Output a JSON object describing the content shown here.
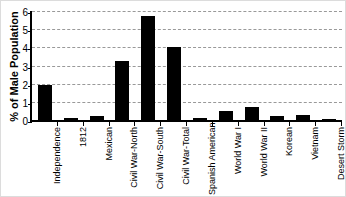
{
  "chart_data": {
    "type": "bar",
    "title": "",
    "xlabel": "",
    "ylabel": "% of Male Population",
    "categories": [
      "Independence",
      "1812",
      "Mexican",
      "Civil War-North",
      "Civil War-South",
      "Civil War-Total",
      "Spanish American",
      "World War I",
      "World War II",
      "Korean",
      "Vietnam",
      "Desert Storm"
    ],
    "values": [
      1.9,
      0.1,
      0.2,
      3.25,
      5.75,
      4.0,
      0.1,
      0.5,
      0.7,
      0.2,
      0.25,
      0.05
    ],
    "ylim": [
      0,
      6
    ],
    "ytick_interval": 1,
    "yticks": [
      "0",
      "1",
      "2",
      "3",
      "4",
      "5",
      "6"
    ],
    "grid": "horizontal-dashed",
    "legend": "none",
    "bar_color": "#000000",
    "gridline_color": "#999999",
    "axis_color": "#000000",
    "background_color": "#ffffff"
  }
}
